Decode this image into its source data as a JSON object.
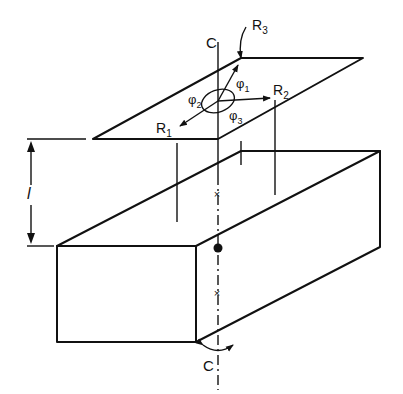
{
  "figure": {
    "axis_label_top": "C",
    "axis_label_bottom": "C",
    "dimension_label": "l",
    "labels": {
      "R1": {
        "base": "R",
        "sub": "1"
      },
      "R2": {
        "base": "R",
        "sub": "2"
      },
      "R3": {
        "base": "R",
        "sub": "3"
      },
      "phi1": {
        "base": "φ",
        "sub": "1"
      },
      "phi2": {
        "base": "φ",
        "sub": "2"
      },
      "phi3": {
        "base": "φ",
        "sub": "3"
      }
    },
    "colors": {
      "ink": "#111111",
      "background": "#ffffff"
    }
  }
}
